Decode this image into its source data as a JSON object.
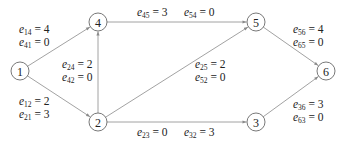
{
  "diagram": {
    "type": "directed-graph",
    "nodes": [
      {
        "id": "1",
        "label": "1",
        "x": 20,
        "y": 71
      },
      {
        "id": "2",
        "label": "2",
        "x": 98,
        "y": 122
      },
      {
        "id": "3",
        "label": "3",
        "x": 256,
        "y": 122
      },
      {
        "id": "4",
        "label": "4",
        "x": 98,
        "y": 22
      },
      {
        "id": "5",
        "label": "5",
        "x": 256,
        "y": 22
      },
      {
        "id": "6",
        "label": "6",
        "x": 326,
        "y": 71
      }
    ],
    "edges": [
      {
        "from": "1",
        "to": "4"
      },
      {
        "from": "1",
        "to": "2"
      },
      {
        "from": "2",
        "to": "4"
      },
      {
        "from": "4",
        "to": "5"
      },
      {
        "from": "2",
        "to": "5"
      },
      {
        "from": "2",
        "to": "3"
      },
      {
        "from": "5",
        "to": "6"
      },
      {
        "from": "3",
        "to": "6"
      }
    ],
    "labels": {
      "e14": {
        "sym": "e",
        "sub": "14",
        "val": "= 4"
      },
      "e41": {
        "sym": "e",
        "sub": "41",
        "val": "= 0"
      },
      "e12": {
        "sym": "e",
        "sub": "12",
        "val": "= 2"
      },
      "e21": {
        "sym": "e",
        "sub": "21",
        "val": "= 3"
      },
      "e24": {
        "sym": "e",
        "sub": "24",
        "val": "= 2"
      },
      "e42": {
        "sym": "e",
        "sub": "42",
        "val": "= 0"
      },
      "e45": {
        "sym": "e",
        "sub": "45",
        "val": "= 3"
      },
      "e54": {
        "sym": "e",
        "sub": "54",
        "val": "= 0"
      },
      "e25": {
        "sym": "e",
        "sub": "25",
        "val": "= 2"
      },
      "e52": {
        "sym": "e",
        "sub": "52",
        "val": "= 0"
      },
      "e23": {
        "sym": "e",
        "sub": "23",
        "val": "= 0"
      },
      "e32": {
        "sym": "e",
        "sub": "32",
        "val": "= 3"
      },
      "e56": {
        "sym": "e",
        "sub": "56",
        "val": "= 4"
      },
      "e65": {
        "sym": "e",
        "sub": "65",
        "val": "= 0"
      },
      "e36": {
        "sym": "e",
        "sub": "36",
        "val": "= 3"
      },
      "e63": {
        "sym": "e",
        "sub": "63",
        "val": "= 0"
      }
    },
    "colors": {
      "edge": "#8a8a8a",
      "node_stroke": "#555555",
      "text": "#222222"
    }
  }
}
